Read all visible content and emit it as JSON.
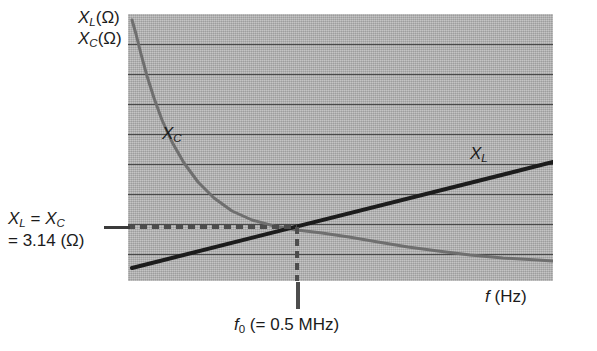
{
  "figure": {
    "y_axis_label_line1": "X",
    "y_axis_label_line1_sub": "L",
    "y_axis_label_line1_unit": "(Ω)",
    "y_axis_label_line2": "X",
    "y_axis_label_line2_sub": "C",
    "y_axis_label_line2_unit": "(Ω)",
    "x_axis_label": "f",
    "x_axis_label_unit": "(Hz)",
    "xc_curve_label": "X",
    "xc_curve_label_sub": "C",
    "xl_curve_label": "X",
    "xl_curve_label_sub": "L",
    "resonance_line1_a": "X",
    "resonance_line1_a_sub": "L",
    "resonance_line1_eq": " = ",
    "resonance_line1_b": "X",
    "resonance_line1_b_sub": "C",
    "resonance_line2": "= 3.14 (Ω)",
    "f0_label_symbol": "f",
    "f0_label_sub": "0",
    "f0_label_value": " (= 0.5 MHz)"
  },
  "chart_data": {
    "type": "line",
    "title": "",
    "xlabel": "f (Hz)",
    "ylabel": "X_L (Ω), X_C (Ω)",
    "grid": true,
    "legend": "inline-curve-labels",
    "background_color": "#ababab",
    "gridline_color": "#4a4a4a",
    "plot_left_px": 128,
    "plot_top_px": 14,
    "plot_width_px": 425,
    "plot_height_px": 267,
    "gridline_y_px": [
      44,
      74,
      104,
      134,
      164,
      194,
      224,
      254
    ],
    "resonance": {
      "f0_label": "f0 (= 0.5 MHz)",
      "f0_value_mhz": 0.5,
      "reactance_label": "X_L = X_C = 3.14 (Ω)",
      "reactance_value_ohm": 3.14,
      "intersection_px": [
        297,
        227
      ],
      "marker_color": "#4d4d4d",
      "marker_style": "dashed"
    },
    "series": [
      {
        "name": "X_C",
        "label": "X_C",
        "color": "#6f6f6f",
        "width_px": 3,
        "description": "capacitive reactance, inversely proportional to frequency; decays hyperbolically",
        "points_px": [
          [
            4,
            6
          ],
          [
            8,
            20
          ],
          [
            13,
            40
          ],
          [
            19,
            62
          ],
          [
            26,
            84
          ],
          [
            34,
            106
          ],
          [
            44,
            128
          ],
          [
            56,
            149
          ],
          [
            70,
            168
          ],
          [
            86,
            184
          ],
          [
            104,
            197
          ],
          [
            124,
            206
          ],
          [
            146,
            212
          ],
          [
            169,
            216
          ],
          [
            194,
            219
          ],
          [
            221,
            223
          ],
          [
            250,
            228
          ],
          [
            280,
            233
          ],
          [
            310,
            237
          ],
          [
            342,
            241
          ],
          [
            375,
            244
          ],
          [
            410,
            246
          ],
          [
            425,
            247
          ]
        ]
      },
      {
        "name": "X_L",
        "label": "X_L",
        "color": "#1c1c1c",
        "width_px": 4,
        "description": "inductive reactance, proportional to frequency; straight rising line",
        "points_px": [
          [
            4,
            254
          ],
          [
            425,
            148
          ]
        ]
      }
    ]
  }
}
